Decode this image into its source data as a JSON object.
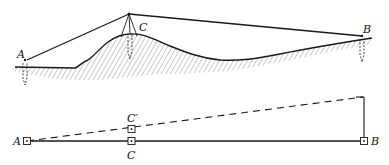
{
  "colors": {
    "ink": "#1a1a1a",
    "background": "#ffffff"
  },
  "top_figure": {
    "description": "Terrain profile with survey line from A over hill station C to B",
    "labels": {
      "a": "A",
      "c": "C",
      "b": "B"
    }
  },
  "bottom_figure": {
    "description": "Plan view: straight line A–C–B with offset point C' on dashed line from A",
    "labels": {
      "a": "A",
      "c": "C",
      "c_prime": "C′",
      "b": "B"
    }
  }
}
